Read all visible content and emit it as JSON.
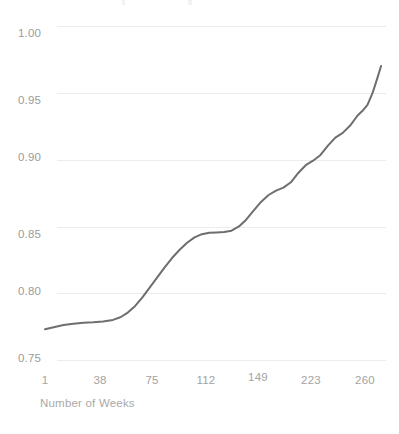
{
  "chart_data": {
    "type": "line",
    "title": "",
    "subtitle": "",
    "xlabel": "Number of Weeks",
    "ylabel": "",
    "xlim": [
      1,
      273
    ],
    "ylim": [
      0.75,
      1.0
    ],
    "grid": true,
    "legend": null,
    "legend_position": "none",
    "line_color": "#6e6e6e",
    "grid_color": "#ececec",
    "tick_label_color": "#9b9b9b",
    "background": "#ffffff",
    "x_ticks": [
      1,
      38,
      75,
      112,
      149,
      223,
      260
    ],
    "x_tick_labels": [
      "1",
      "38",
      "75",
      "112",
      "149",
      "223",
      "260"
    ],
    "y_ticks": [
      0.75,
      0.8,
      0.85,
      0.9,
      0.95,
      1.0
    ],
    "y_tick_labels": [
      "0.75",
      "0.80",
      "0.85",
      "0.90",
      "0.95",
      "1.00"
    ],
    "series": [
      {
        "name": "cumulative-curve",
        "x": [
          1,
          8,
          16,
          24,
          32,
          40,
          48,
          56,
          62,
          68,
          74,
          80,
          86,
          92,
          98,
          104,
          110,
          116,
          122,
          128,
          134,
          140,
          146,
          152,
          158,
          164,
          170,
          176,
          182,
          188,
          194,
          200,
          206,
          212,
          218,
          224,
          230,
          236,
          242,
          248,
          254,
          258,
          262,
          266,
          270,
          273
        ],
        "y": [
          0.773,
          0.7745,
          0.7762,
          0.7772,
          0.7778,
          0.7782,
          0.7788,
          0.78,
          0.782,
          0.7855,
          0.7905,
          0.797,
          0.8045,
          0.812,
          0.8195,
          0.8265,
          0.8325,
          0.8378,
          0.8418,
          0.8442,
          0.8452,
          0.8455,
          0.8458,
          0.8468,
          0.85,
          0.8552,
          0.862,
          0.8685,
          0.8735,
          0.8768,
          0.879,
          0.883,
          0.89,
          0.8958,
          0.8992,
          0.9035,
          0.9105,
          0.9165,
          0.92,
          0.9255,
          0.933,
          0.9365,
          0.941,
          0.9495,
          0.961,
          0.97
        ]
      }
    ]
  },
  "axes": {
    "x_title": "Number of Weeks"
  }
}
